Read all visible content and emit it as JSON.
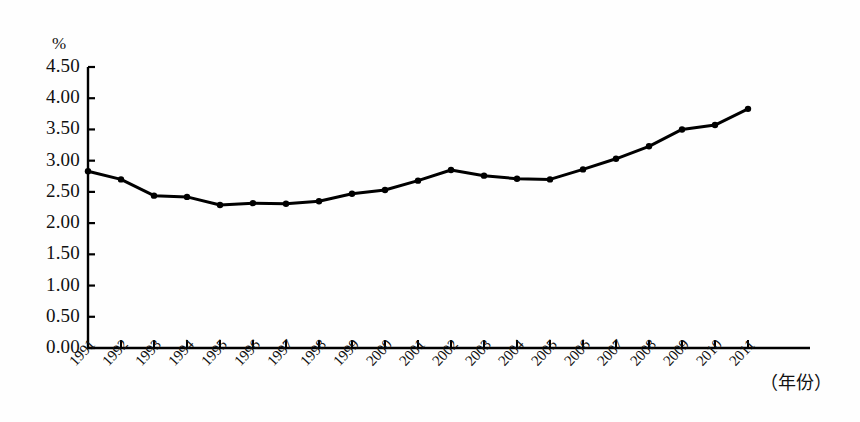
{
  "chart_data": {
    "type": "line",
    "title": "",
    "subtitle": "",
    "xlabel": "（年份）",
    "ylabel": "%",
    "unit_label": "%",
    "categories": [
      "1991",
      "1992",
      "1993",
      "1994",
      "1995",
      "1996",
      "1997",
      "1998",
      "1999",
      "2000",
      "2001",
      "2002",
      "2003",
      "2004",
      "2005",
      "2006",
      "2007",
      "2008",
      "2009",
      "2010",
      "2011"
    ],
    "values": [
      2.83,
      2.7,
      2.44,
      2.42,
      2.29,
      2.32,
      2.31,
      2.35,
      2.47,
      2.53,
      2.68,
      2.85,
      2.76,
      2.71,
      2.7,
      2.86,
      3.03,
      3.23,
      3.5,
      3.57,
      3.83
    ],
    "series": [
      {
        "name": "",
        "values": [
          2.83,
          2.7,
          2.44,
          2.42,
          2.29,
          2.32,
          2.31,
          2.35,
          2.47,
          2.53,
          2.68,
          2.85,
          2.76,
          2.71,
          2.7,
          2.86,
          3.03,
          3.23,
          3.5,
          3.57,
          3.83
        ],
        "color": "#000000",
        "marker": "circle"
      }
    ],
    "ylim": [
      0.0,
      4.5
    ],
    "yticks": [
      0.0,
      0.5,
      1.0,
      1.5,
      2.0,
      2.5,
      3.0,
      3.5,
      4.0,
      4.5
    ],
    "ytick_labels": [
      "0.00",
      "0.50",
      "1.00",
      "1.50",
      "2.00",
      "2.50",
      "3.00",
      "3.50",
      "4.00",
      "4.50"
    ],
    "xtick_labels": [
      "1991",
      "1992",
      "1993",
      "1994",
      "1995",
      "1996",
      "1997",
      "1998",
      "1999",
      "2000",
      "2001",
      "2002",
      "2003",
      "2004",
      "2005",
      "2006",
      "2007",
      "2008",
      "2009",
      "2010",
      "2011"
    ],
    "grid": false,
    "legend": false,
    "legend_position": "none",
    "axis_style": "left-and-bottom-spines",
    "line_color": "#000000",
    "marker_color": "#000000",
    "background_color": "#ffffff"
  }
}
